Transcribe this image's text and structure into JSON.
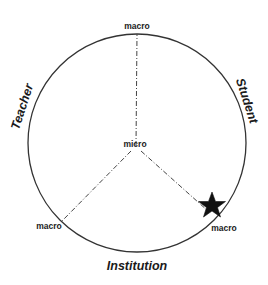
{
  "diagram": {
    "type": "radial-axes-circle",
    "center_label": "micro",
    "axes": [
      {
        "name": "top",
        "end_label": "macro"
      },
      {
        "name": "lower-left",
        "end_label": "macro"
      },
      {
        "name": "lower-right",
        "end_label": "macro"
      }
    ],
    "perimeter_labels": {
      "left": "Teacher",
      "right": "Student",
      "bottom": "Institution"
    },
    "marker": {
      "shape": "star",
      "position": "lower-right axis near circle edge"
    },
    "colors": {
      "stroke": "#333333",
      "text": "#222222",
      "marker": "#111111",
      "background": "#ffffff"
    }
  }
}
